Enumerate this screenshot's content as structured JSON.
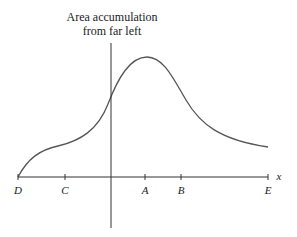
{
  "annotation": {
    "line1": "Area accumulation",
    "line2": "from far left"
  },
  "axis": {
    "label": "x",
    "points": [
      {
        "name": "D",
        "x": 18
      },
      {
        "name": "C",
        "x": 65
      },
      {
        "name": "A",
        "x": 145
      },
      {
        "name": "B",
        "x": 181
      },
      {
        "name": "E",
        "x": 268
      }
    ]
  },
  "colors": {
    "curve": "#555555",
    "axis": "#333333"
  }
}
